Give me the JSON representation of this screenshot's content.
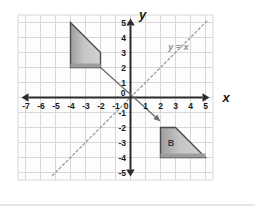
{
  "figure": {
    "title": "",
    "axes": {
      "x_axis_label": "x",
      "y_axis_label": "y",
      "x_ticks": [
        "-7",
        "-6",
        "-5",
        "-4",
        "-3",
        "-2",
        "-1",
        "0",
        "1",
        "2",
        "3",
        "4",
        "5"
      ],
      "x_tick_values": [
        -7,
        -6,
        -5,
        -4,
        -3,
        -2,
        -1,
        0,
        1,
        2,
        3,
        4,
        5
      ],
      "y_ticks": [
        "5",
        "4",
        "3",
        "2",
        "1",
        "0",
        "-1",
        "-2",
        "-3",
        "-4",
        "-5"
      ],
      "y_tick_values": [
        5,
        4,
        3,
        2,
        1,
        0,
        -1,
        -2,
        -3,
        -4,
        -5
      ],
      "x_range": [
        -7.5,
        5.5
      ],
      "y_range": [
        -5.5,
        5.5
      ],
      "grid": true,
      "grid_step": 1
    },
    "line": {
      "label": "y = x",
      "equation_label_x": 3.2,
      "equation_label_y": 3.2,
      "style": "dashed",
      "from": [
        -5.2,
        -5.2
      ],
      "to": [
        5.2,
        5.2
      ]
    },
    "shapes": [
      {
        "name": "preimage-trapezoid",
        "label": "",
        "vertices": [
          [
            -4,
            5
          ],
          [
            -2,
            3
          ],
          [
            -2,
            2
          ],
          [
            -4,
            2
          ]
        ]
      },
      {
        "name": "image-trapezoid-b",
        "label": "B",
        "label_x": 2.7,
        "label_y": -3.0,
        "vertices": [
          [
            2,
            -2
          ],
          [
            3,
            -2
          ],
          [
            5,
            -4
          ],
          [
            2,
            -4
          ]
        ]
      }
    ],
    "arrow": {
      "name": "reflection-arrow",
      "from": [
        -2,
        2
      ],
      "to": [
        2,
        -1.6
      ]
    },
    "colors": {
      "grid": "#d8d8d8",
      "axis": "#2b2b2b",
      "shape_fill": "#b8b8b8",
      "shape_stroke": "#4a4a4a",
      "line": "#9a9a9a",
      "text": "#1a1a1a",
      "separator": "#cccccc"
    }
  }
}
